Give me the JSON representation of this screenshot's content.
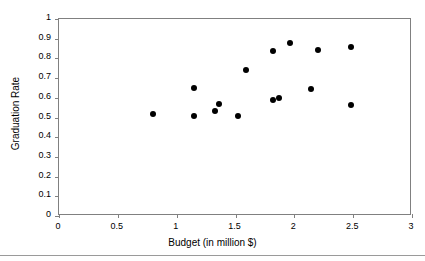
{
  "chart_data": {
    "type": "scatter",
    "title": "",
    "xlabel": "Budget (in million $)",
    "ylabel": "Graduation Rate",
    "xlim": [
      0,
      3
    ],
    "ylim": [
      0,
      1
    ],
    "grid": false,
    "legend": null,
    "marker": {
      "shape": "circle",
      "color": "#000000",
      "size_px": 6
    },
    "frame_color": "#808080",
    "xticks": [
      "0",
      "0.5",
      "1",
      "1.5",
      "2",
      "2.5",
      "3"
    ],
    "xtick_values": [
      0,
      0.5,
      1,
      1.5,
      2,
      2.5,
      3
    ],
    "yticks": [
      "0",
      "0.1",
      "0.2",
      "0.3",
      "0.4",
      "0.5",
      "0.6",
      "0.7",
      "0.8",
      "0.9",
      "1"
    ],
    "ytick_values": [
      0,
      0.1,
      0.2,
      0.3,
      0.4,
      0.5,
      0.6,
      0.7,
      0.8,
      0.9,
      1
    ],
    "x": [
      0.8,
      1.15,
      1.15,
      1.33,
      1.36,
      1.52,
      1.59,
      1.82,
      1.82,
      1.87,
      1.96,
      2.14,
      2.2,
      2.48,
      2.48
    ],
    "y": [
      0.52,
      0.51,
      0.65,
      0.535,
      0.57,
      0.51,
      0.74,
      0.59,
      0.84,
      0.6,
      0.88,
      0.645,
      0.845,
      0.565,
      0.86
    ],
    "points": [
      {
        "x": 0.8,
        "y": 0.52
      },
      {
        "x": 1.15,
        "y": 0.51
      },
      {
        "x": 1.15,
        "y": 0.65
      },
      {
        "x": 1.33,
        "y": 0.535
      },
      {
        "x": 1.36,
        "y": 0.57
      },
      {
        "x": 1.52,
        "y": 0.51
      },
      {
        "x": 1.59,
        "y": 0.74
      },
      {
        "x": 1.82,
        "y": 0.59
      },
      {
        "x": 1.82,
        "y": 0.84
      },
      {
        "x": 1.87,
        "y": 0.6
      },
      {
        "x": 1.96,
        "y": 0.88
      },
      {
        "x": 2.14,
        "y": 0.645
      },
      {
        "x": 2.2,
        "y": 0.845
      },
      {
        "x": 2.48,
        "y": 0.565
      },
      {
        "x": 2.48,
        "y": 0.86
      }
    ]
  }
}
